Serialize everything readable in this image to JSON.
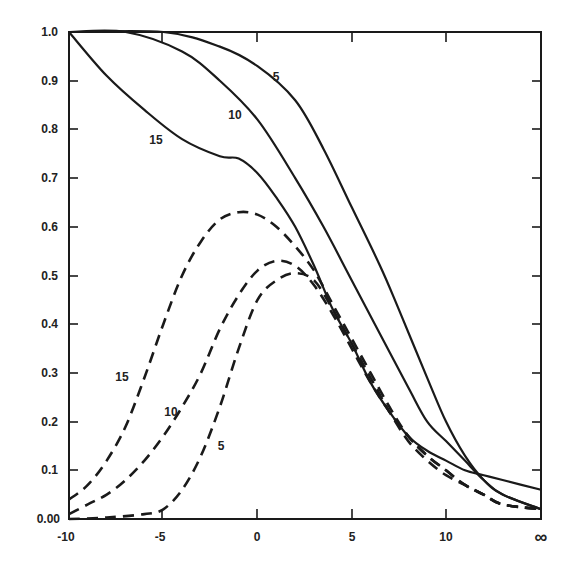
{
  "chart_data": {
    "type": "line",
    "title": "",
    "xlabel": "",
    "ylabel": "",
    "xlim": [
      -10,
      "∞"
    ],
    "ylim": [
      0.0,
      1.0
    ],
    "grid": false,
    "legend": "none (curves labeled inline)",
    "x_tick_labels": [
      "-10",
      "-5",
      "0",
      "5",
      "10",
      "∞"
    ],
    "y_tick_labels": [
      "0.00",
      "0.1",
      "0.2",
      "0.3",
      "0.4",
      "0.5",
      "0.6",
      "0.7",
      "0.8",
      "0.9",
      "1.0"
    ],
    "series": [
      {
        "name": "5",
        "style": "solid",
        "points": [
          [
            -10,
            1.0
          ],
          [
            -5,
            1.0
          ],
          [
            -2,
            0.97
          ],
          [
            0,
            0.93
          ],
          [
            2,
            0.86
          ],
          [
            3.5,
            0.76
          ],
          [
            5,
            0.64
          ],
          [
            6.5,
            0.52
          ],
          [
            7.5,
            0.43
          ],
          [
            9,
            0.29
          ],
          [
            10,
            0.2
          ],
          [
            11,
            0.13
          ],
          [
            12,
            0.08
          ],
          [
            13,
            0.05
          ],
          [
            "∞",
            0.02
          ]
        ]
      },
      {
        "name": "10",
        "style": "solid",
        "points": [
          [
            -10,
            1.0
          ],
          [
            -7,
            1.0
          ],
          [
            -4,
            0.96
          ],
          [
            -2,
            0.9
          ],
          [
            0,
            0.82
          ],
          [
            2,
            0.7
          ],
          [
            3.5,
            0.6
          ],
          [
            5,
            0.49
          ],
          [
            6.5,
            0.38
          ],
          [
            8,
            0.27
          ],
          [
            9,
            0.2
          ],
          [
            10,
            0.16
          ],
          [
            11,
            0.12
          ],
          [
            12,
            0.08
          ],
          [
            13,
            0.05
          ],
          [
            "∞",
            0.02
          ]
        ]
      },
      {
        "name": "15",
        "style": "solid",
        "points": [
          [
            -10,
            1.0
          ],
          [
            -8,
            0.91
          ],
          [
            -6,
            0.84
          ],
          [
            -4,
            0.78
          ],
          [
            -2,
            0.745
          ],
          [
            -1,
            0.74
          ],
          [
            0,
            0.71
          ],
          [
            1,
            0.66
          ],
          [
            2,
            0.6
          ],
          [
            3,
            0.52
          ],
          [
            4,
            0.43
          ],
          [
            5,
            0.36
          ],
          [
            6,
            0.28
          ],
          [
            7,
            0.22
          ],
          [
            8,
            0.17
          ],
          [
            9,
            0.14
          ],
          [
            10,
            0.12
          ],
          [
            11,
            0.1
          ],
          [
            12,
            0.09
          ],
          [
            13,
            0.08
          ],
          [
            "∞",
            0.06
          ]
        ]
      },
      {
        "name": "15",
        "style": "dashed",
        "points": [
          [
            -10,
            0.04
          ],
          [
            -9,
            0.07
          ],
          [
            -8,
            0.12
          ],
          [
            -7,
            0.19
          ],
          [
            -6,
            0.29
          ],
          [
            -5,
            0.4
          ],
          [
            -4,
            0.5
          ],
          [
            -3,
            0.57
          ],
          [
            -2,
            0.615
          ],
          [
            -1,
            0.63
          ],
          [
            0,
            0.625
          ],
          [
            1,
            0.6
          ],
          [
            2,
            0.56
          ],
          [
            3,
            0.51
          ],
          [
            4,
            0.44
          ],
          [
            5,
            0.37
          ],
          [
            6,
            0.3
          ],
          [
            7,
            0.23
          ],
          [
            8,
            0.17
          ],
          [
            9,
            0.13
          ],
          [
            10,
            0.1
          ],
          [
            11,
            0.07
          ],
          [
            12,
            0.05
          ],
          [
            13,
            0.03
          ],
          [
            "∞",
            0.02
          ]
        ]
      },
      {
        "name": "10",
        "style": "dashed",
        "points": [
          [
            -10,
            0.01
          ],
          [
            -9,
            0.03
          ],
          [
            -8,
            0.05
          ],
          [
            -7,
            0.08
          ],
          [
            -6,
            0.12
          ],
          [
            -5,
            0.17
          ],
          [
            -4,
            0.23
          ],
          [
            -3,
            0.3
          ],
          [
            -2,
            0.39
          ],
          [
            -1,
            0.46
          ],
          [
            0,
            0.51
          ],
          [
            1,
            0.53
          ],
          [
            2,
            0.52
          ],
          [
            3,
            0.48
          ],
          [
            4,
            0.42
          ],
          [
            5,
            0.35
          ],
          [
            6,
            0.28
          ],
          [
            7,
            0.22
          ],
          [
            8,
            0.17
          ],
          [
            9,
            0.13
          ],
          [
            10,
            0.1
          ],
          [
            11,
            0.07
          ],
          [
            12,
            0.05
          ],
          [
            13,
            0.03
          ],
          [
            "∞",
            0.02
          ]
        ]
      },
      {
        "name": "5",
        "style": "dashed",
        "points": [
          [
            -10,
            0.0
          ],
          [
            -8,
            0.003
          ],
          [
            -6,
            0.01
          ],
          [
            -5,
            0.02
          ],
          [
            -4,
            0.06
          ],
          [
            -3,
            0.13
          ],
          [
            -2,
            0.23
          ],
          [
            -1,
            0.35
          ],
          [
            0,
            0.45
          ],
          [
            1,
            0.49
          ],
          [
            2,
            0.505
          ],
          [
            3,
            0.49
          ],
          [
            4,
            0.43
          ],
          [
            5,
            0.36
          ],
          [
            6,
            0.29
          ],
          [
            7,
            0.22
          ],
          [
            8,
            0.16
          ],
          [
            9,
            0.12
          ],
          [
            10,
            0.09
          ],
          [
            11,
            0.07
          ],
          [
            12,
            0.05
          ],
          [
            13,
            0.03
          ],
          [
            "∞",
            0.02
          ]
        ]
      }
    ],
    "annotations": [
      {
        "text": "5",
        "near": "solid-5",
        "x": 1.2,
        "y": 0.88
      },
      {
        "text": "10",
        "near": "solid-10",
        "x": -1.2,
        "y": 0.84
      },
      {
        "text": "15",
        "near": "solid-15",
        "x": -5.3,
        "y": 0.77
      },
      {
        "text": "15",
        "near": "dashed-15",
        "x": -7.5,
        "y": 0.29
      },
      {
        "text": "10",
        "near": "dashed-10",
        "x": -4.8,
        "y": 0.19
      },
      {
        "text": "5",
        "near": "dashed-5",
        "x": -1.9,
        "y": 0.15
      }
    ]
  },
  "axes": {
    "x_ticks": [
      {
        "label": "-10",
        "px": 69
      },
      {
        "label": "-5",
        "px": 162
      },
      {
        "label": "0",
        "px": 257
      },
      {
        "label": "5",
        "px": 352
      },
      {
        "label": "10",
        "px": 446
      },
      {
        "label": "∞",
        "px": 541
      }
    ],
    "y_ticks": [
      {
        "label": "1.0",
        "py": 32
      },
      {
        "label": "0.9",
        "py": 81
      },
      {
        "label": "0.8",
        "py": 129
      },
      {
        "label": "0.7",
        "py": 178
      },
      {
        "label": "0.6",
        "py": 227
      },
      {
        "label": "0.5",
        "py": 276
      },
      {
        "label": "0.4",
        "py": 324
      },
      {
        "label": "0.3",
        "py": 373
      },
      {
        "label": "0.2",
        "py": 422
      },
      {
        "label": "0.1",
        "py": 470
      },
      {
        "label": "0.00",
        "py": 519
      }
    ]
  },
  "labels": {
    "solid_5": "5",
    "solid_10": "10",
    "solid_15": "15",
    "dashed_15": "15",
    "dashed_10": "10",
    "dashed_5": "5"
  },
  "colors": {
    "ink": "#1a1a1a",
    "background": "#ffffff"
  }
}
